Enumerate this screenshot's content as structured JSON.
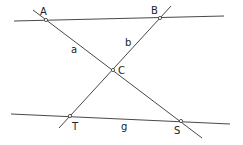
{
  "diagram": {
    "type": "geometry",
    "points": [
      {
        "name": "A",
        "label": "A",
        "x": 46,
        "y": 20,
        "lx": 40,
        "ly": 15
      },
      {
        "name": "B",
        "label": "B",
        "x": 160,
        "y": 18,
        "lx": 151,
        "ly": 14
      },
      {
        "name": "C",
        "label": "C",
        "x": 113,
        "y": 70,
        "lx": 118,
        "ly": 74
      },
      {
        "name": "T",
        "label": "T",
        "x": 70,
        "y": 116,
        "lx": 72,
        "ly": 130
      },
      {
        "name": "S",
        "label": "S",
        "x": 181,
        "y": 121,
        "lx": 174,
        "ly": 134
      }
    ],
    "lines": [
      {
        "name": "top-line",
        "x1": 14,
        "y1": 21,
        "x2": 224,
        "y2": 16
      },
      {
        "name": "line-a",
        "label": "a",
        "x1": 33,
        "y1": 10,
        "x2": 202,
        "y2": 138
      },
      {
        "name": "line-b",
        "label": "b",
        "x1": 171,
        "y1": 6,
        "x2": 59,
        "y2": 128
      },
      {
        "name": "line-g",
        "label": "g",
        "x1": 11,
        "y1": 114,
        "x2": 230,
        "y2": 124
      }
    ],
    "line_labels": [
      {
        "label": "a",
        "x": 71,
        "y": 53
      },
      {
        "label": "b",
        "x": 125,
        "y": 46
      },
      {
        "label": "g",
        "x": 121,
        "y": 130
      }
    ]
  }
}
